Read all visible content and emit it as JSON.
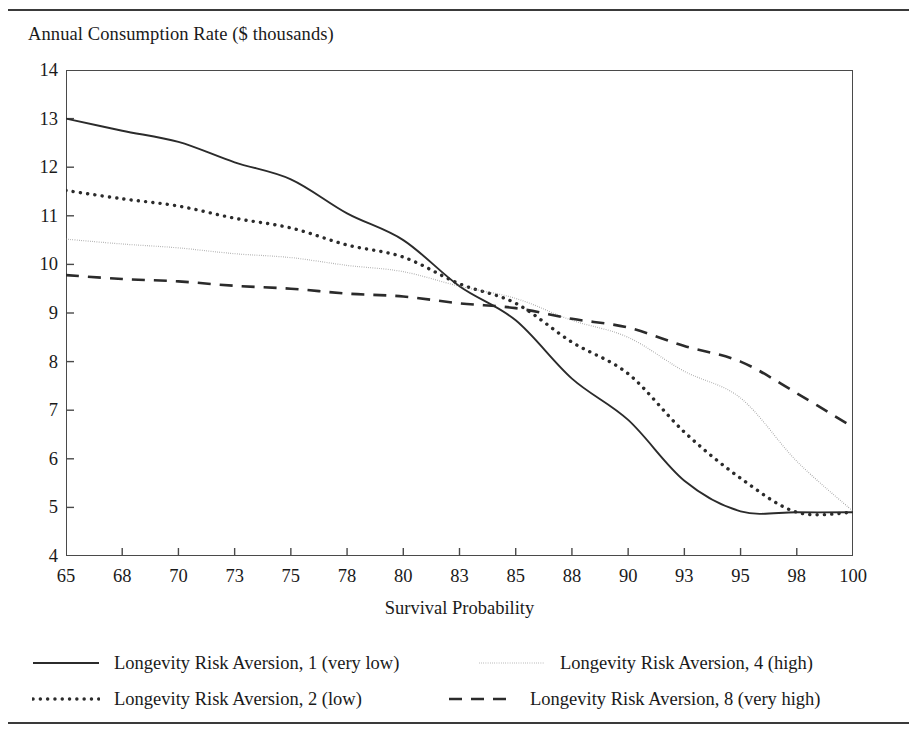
{
  "figure": {
    "title": "Annual Consumption Rate ($ thousands)",
    "xaxis_label": "Survival Probability"
  },
  "rules": {
    "top": "top-rule",
    "bottom": "bottom-rule"
  },
  "legend": {
    "items": [
      {
        "label": "Longevity Risk Aversion, 1 (very low)",
        "style": "solid",
        "color": "#2b2b2b",
        "row": 0,
        "col": 0
      },
      {
        "label": "Longevity Risk Aversion, 4 (high)",
        "style": "fine-dot",
        "color": "#8c8c8c",
        "row": 0,
        "col": 1
      },
      {
        "label": "Longevity Risk Aversion, 2 (low)",
        "style": "heavy-dot",
        "color": "#2b2b2b",
        "row": 1,
        "col": 0
      },
      {
        "label": "Longevity Risk Aversion, 8 (very high)",
        "style": "dash",
        "color": "#2b2b2b",
        "row": 1,
        "col": 1
      }
    ]
  },
  "chart_data": {
    "type": "line",
    "title": "Annual Consumption Rate ($ thousands)",
    "subtitle": "",
    "xlabel": "Survival Probability",
    "ylabel": "Annual Consumption Rate ($ thousands)",
    "x": [
      65,
      68,
      70,
      73,
      75,
      78,
      80,
      83,
      85,
      88,
      90,
      93,
      95,
      98,
      100
    ],
    "categories": [
      "65",
      "68",
      "70",
      "73",
      "75",
      "78",
      "80",
      "83",
      "85",
      "88",
      "90",
      "93",
      "95",
      "98",
      "100"
    ],
    "ylim": [
      4,
      14
    ],
    "yticks": [
      4,
      5,
      6,
      7,
      8,
      9,
      10,
      11,
      12,
      13,
      14
    ],
    "xlim_index": [
      0,
      14
    ],
    "grid": false,
    "legend_position": "bottom",
    "axis_type": "categorical-even-spacing",
    "series": [
      {
        "name": "Longevity Risk Aversion, 1 (very low)",
        "style": "solid",
        "color": "#2b2b2b",
        "values": [
          13.0,
          12.75,
          12.52,
          12.1,
          11.75,
          11.05,
          10.5,
          9.55,
          8.85,
          7.65,
          6.8,
          5.55,
          4.92,
          4.9,
          4.9
        ]
      },
      {
        "name": "Longevity Risk Aversion, 2 (low)",
        "style": "heavy-dot",
        "color": "#2b2b2b",
        "values": [
          11.52,
          11.35,
          11.2,
          10.95,
          10.75,
          10.4,
          10.15,
          9.6,
          9.2,
          8.4,
          7.75,
          6.55,
          5.6,
          4.9,
          4.9
        ]
      },
      {
        "name": "Longevity Risk Aversion, 4 (high)",
        "style": "fine-dot",
        "color": "#8c8c8c",
        "values": [
          10.52,
          10.42,
          10.34,
          10.22,
          10.14,
          9.98,
          9.85,
          9.55,
          9.3,
          8.85,
          8.5,
          7.8,
          7.25,
          5.95,
          4.92
        ]
      },
      {
        "name": "Longevity Risk Aversion, 8 (very high)",
        "style": "dash",
        "color": "#2b2b2b",
        "values": [
          9.78,
          9.7,
          9.65,
          9.56,
          9.5,
          9.4,
          9.34,
          9.2,
          9.1,
          8.88,
          8.7,
          8.32,
          8.0,
          7.35,
          6.65
        ]
      }
    ]
  }
}
